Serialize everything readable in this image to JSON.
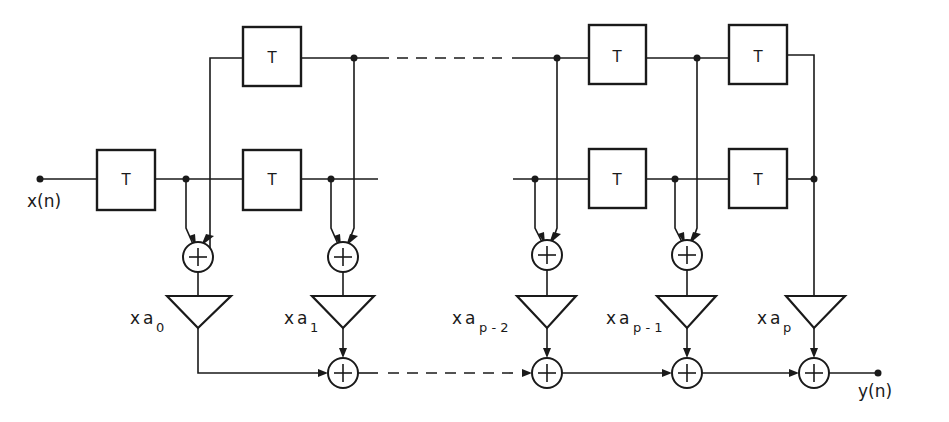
{
  "diagram": {
    "type": "lattice / tapped delay-line filter block diagram",
    "input_label": "x(n)",
    "output_label": "y(n)",
    "delay_label": "T",
    "delay_count": 7,
    "adder_symbol": "+",
    "coefficients": [
      {
        "prefix": "x",
        "symbol": "a",
        "subscript": "0"
      },
      {
        "prefix": "x",
        "symbol": "a",
        "subscript": "1"
      },
      {
        "prefix": "x",
        "symbol": "a",
        "subscript": "p - 2"
      },
      {
        "prefix": "x",
        "symbol": "a",
        "subscript": "p - 1"
      },
      {
        "prefix": "x",
        "symbol": "a",
        "subscript": "p"
      }
    ],
    "colors": {
      "line": "#1a1a1a",
      "background": "#ffffff"
    }
  }
}
